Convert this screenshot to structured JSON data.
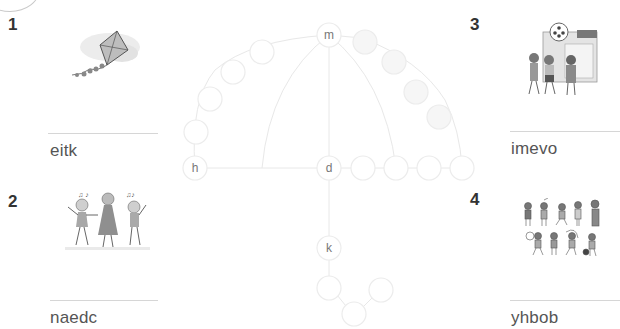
{
  "items": [
    {
      "number": "1",
      "scrambled_word": "eitk",
      "picture": "kite"
    },
    {
      "number": "2",
      "scrambled_word": "naedc",
      "picture": "children dancing"
    },
    {
      "number": "3",
      "scrambled_word": "imevo",
      "picture": "friends going to cinema"
    },
    {
      "number": "4",
      "scrambled_word": "yhbob",
      "picture": "children doing hobbies and sports"
    }
  ],
  "puzzle": {
    "given_letters": {
      "m": "m",
      "h": "h",
      "d": "d",
      "k": "k"
    }
  },
  "colors": {
    "number_text": "#333333",
    "word_text": "#555555",
    "circle_stroke": "#e6e6e6",
    "rule": "#d6d6d6"
  }
}
